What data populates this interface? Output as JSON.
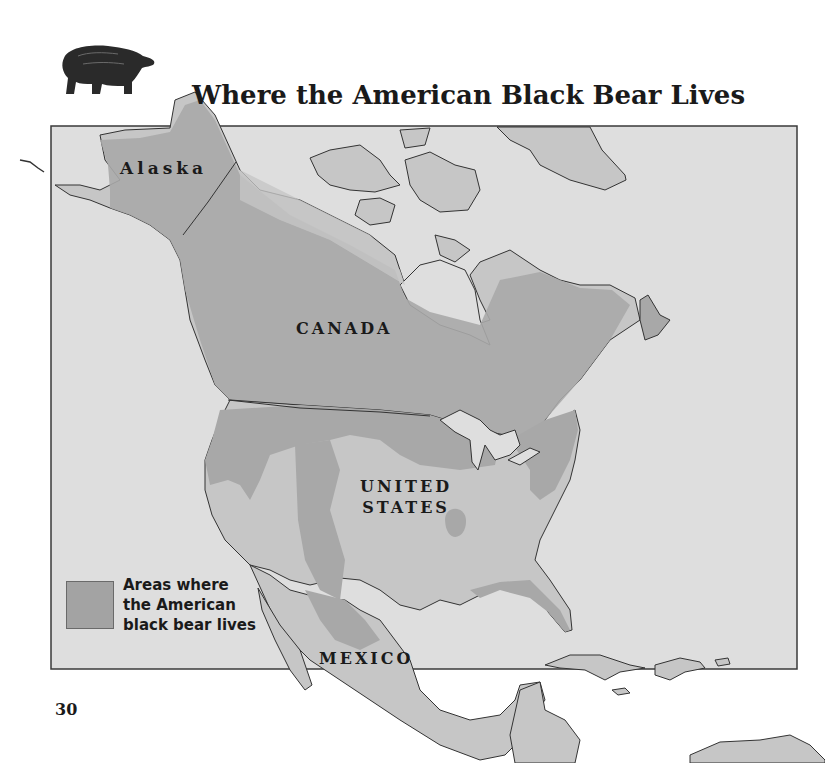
{
  "page": {
    "title": "Where the American Black Bear Lives",
    "page_number": "30",
    "header_icon": "black-bear-illustration"
  },
  "map": {
    "labels": {
      "alaska": "Alaska",
      "canada": "CANADA",
      "united_states_line1": "UNITED",
      "united_states_line2": "STATES",
      "mexico": "MEXICO"
    },
    "legend": {
      "line1": "Areas where",
      "line2": "the American",
      "line3": "black bear lives",
      "swatch_color": "#a3a3a3"
    },
    "colors": {
      "ocean": "#dedede",
      "land": "#c6c6c6",
      "bear_range": "#a8a8a8",
      "outline": "#333333",
      "frame": "#3a3a3a"
    }
  }
}
